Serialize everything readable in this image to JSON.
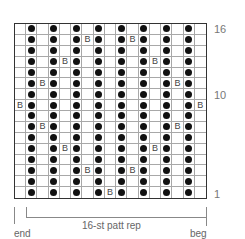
{
  "chart": {
    "columns": 17,
    "rows": 16,
    "key": {
      "o": "dot",
      "B": "bead",
      "": "empty"
    },
    "grid_top_to_bottom": [
      {
        "row": 16,
        "cells": [
          "",
          "o",
          "",
          "o",
          "",
          "o",
          "",
          "o",
          "",
          "o",
          "",
          "o",
          "",
          "o",
          "",
          "o",
          ""
        ]
      },
      {
        "row": 15,
        "cells": [
          "",
          "o",
          "",
          "o",
          "",
          "o",
          "B",
          "o",
          "",
          "o",
          "B",
          "o",
          "",
          "o",
          "",
          "o",
          ""
        ]
      },
      {
        "row": 14,
        "cells": [
          "",
          "o",
          "",
          "o",
          "",
          "o",
          "",
          "o",
          "",
          "o",
          "",
          "o",
          "",
          "o",
          "",
          "o",
          ""
        ]
      },
      {
        "row": 13,
        "cells": [
          "",
          "o",
          "",
          "o",
          "B",
          "o",
          "",
          "o",
          "",
          "o",
          "",
          "o",
          "B",
          "o",
          "",
          "o",
          ""
        ]
      },
      {
        "row": 12,
        "cells": [
          "",
          "o",
          "",
          "o",
          "",
          "o",
          "",
          "o",
          "",
          "o",
          "",
          "o",
          "",
          "o",
          "",
          "o",
          ""
        ]
      },
      {
        "row": 11,
        "cells": [
          "",
          "o",
          "B",
          "o",
          "",
          "o",
          "",
          "o",
          "",
          "o",
          "",
          "o",
          "",
          "o",
          "B",
          "o",
          ""
        ]
      },
      {
        "row": 10,
        "cells": [
          "",
          "o",
          "",
          "o",
          "",
          "o",
          "",
          "o",
          "",
          "o",
          "",
          "o",
          "",
          "o",
          "",
          "o",
          ""
        ]
      },
      {
        "row": 9,
        "cells": [
          "B",
          "o",
          "",
          "o",
          "",
          "o",
          "",
          "o",
          "",
          "o",
          "",
          "o",
          "",
          "o",
          "",
          "o",
          "B"
        ]
      },
      {
        "row": 8,
        "cells": [
          "",
          "o",
          "",
          "o",
          "",
          "o",
          "",
          "o",
          "",
          "o",
          "",
          "o",
          "",
          "o",
          "",
          "o",
          ""
        ]
      },
      {
        "row": 7,
        "cells": [
          "",
          "o",
          "B",
          "o",
          "",
          "o",
          "",
          "o",
          "",
          "o",
          "",
          "o",
          "",
          "o",
          "B",
          "o",
          ""
        ]
      },
      {
        "row": 6,
        "cells": [
          "",
          "o",
          "",
          "o",
          "",
          "o",
          "",
          "o",
          "",
          "o",
          "",
          "o",
          "",
          "o",
          "",
          "o",
          ""
        ]
      },
      {
        "row": 5,
        "cells": [
          "",
          "o",
          "",
          "o",
          "B",
          "o",
          "",
          "o",
          "",
          "o",
          "",
          "o",
          "B",
          "o",
          "",
          "o",
          ""
        ]
      },
      {
        "row": 4,
        "cells": [
          "",
          "o",
          "",
          "o",
          "",
          "o",
          "",
          "o",
          "",
          "o",
          "",
          "o",
          "",
          "o",
          "",
          "o",
          ""
        ]
      },
      {
        "row": 3,
        "cells": [
          "",
          "o",
          "",
          "o",
          "",
          "o",
          "B",
          "o",
          "",
          "o",
          "B",
          "o",
          "",
          "o",
          "",
          "o",
          ""
        ]
      },
      {
        "row": 2,
        "cells": [
          "",
          "o",
          "",
          "o",
          "",
          "o",
          "",
          "o",
          "",
          "o",
          "",
          "o",
          "",
          "o",
          "",
          "o",
          ""
        ]
      },
      {
        "row": 1,
        "cells": [
          "",
          "o",
          "",
          "o",
          "",
          "o",
          "",
          "o",
          "B",
          "o",
          "",
          "o",
          "",
          "o",
          "",
          "o",
          ""
        ]
      }
    ],
    "bead_symbol": "B"
  },
  "row_labels": [
    {
      "text": "16",
      "row": 16
    },
    {
      "text": "10",
      "row": 10
    },
    {
      "text": "1",
      "row": 1
    }
  ],
  "bottom": {
    "repeat_label": "16-st patt rep",
    "end_label": "end",
    "beg_label": "beg"
  }
}
